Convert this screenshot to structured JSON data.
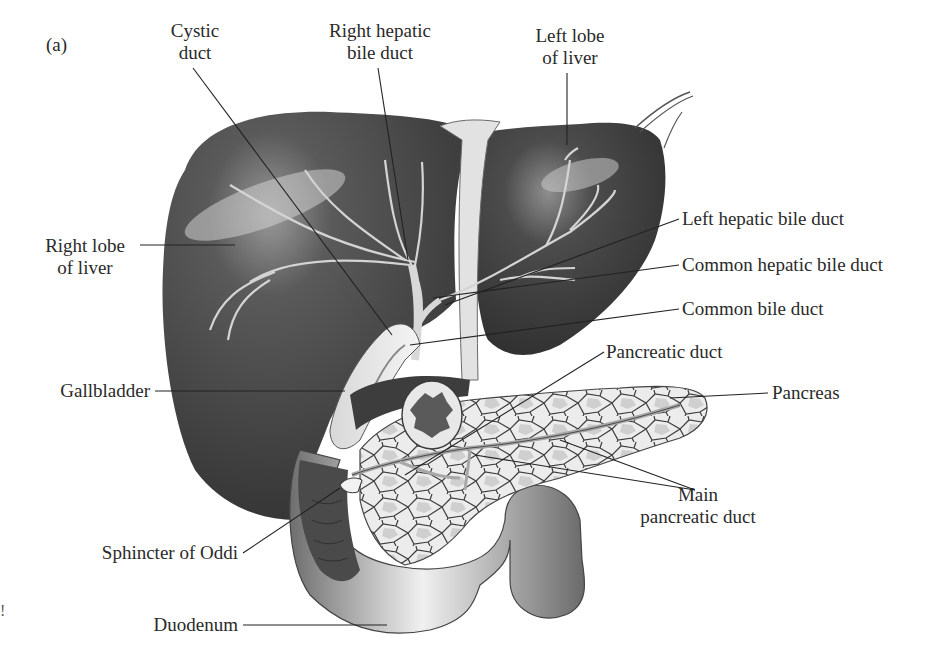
{
  "figure": {
    "panel_label": "(a)",
    "stray_mark": "!"
  },
  "labels": {
    "cystic_duct": [
      "Cystic",
      "duct"
    ],
    "right_hepatic_bile_duct": [
      "Right hepatic",
      "bile duct"
    ],
    "left_lobe_of_liver": [
      "Left lobe",
      "of liver"
    ],
    "right_lobe_of_liver": [
      "Right lobe",
      "of liver"
    ],
    "left_hepatic_bile_duct": "Left hepatic bile duct",
    "common_hepatic_bile_duct": "Common hepatic bile duct",
    "common_bile_duct": "Common bile duct",
    "pancreatic_duct": "Pancreatic duct",
    "gallbladder": "Gallbladder",
    "pancreas": "Pancreas",
    "main_pancreatic_duct": [
      "Main",
      "pancreatic duct"
    ],
    "sphincter_of_oddi": "Sphincter of Oddi",
    "duodenum": "Duodenum"
  },
  "colors": {
    "liver": "#3a3a3a",
    "liver_highlight": "#bdbdbd",
    "duct": "#cfcfcf",
    "pancreas": "#e6e6e6",
    "duodenum": "#8a8a8a",
    "leader_line": "#222222",
    "text": "#2a2a2a"
  }
}
